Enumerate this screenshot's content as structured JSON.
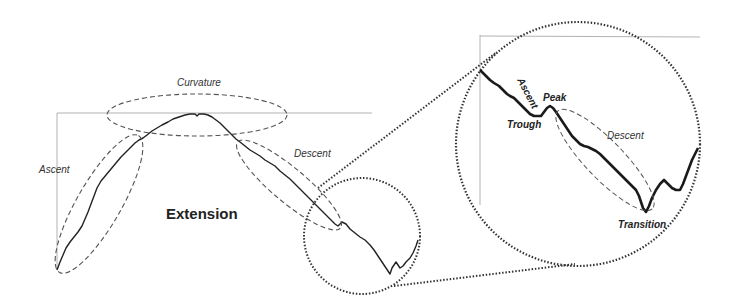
{
  "diagram": {
    "title": "Extension",
    "left_panel": {
      "labels": {
        "curvature": "Curvature",
        "ascent": "Ascent",
        "descent": "Descent",
        "extension": "Extension"
      }
    },
    "magnified_panel": {
      "labels": {
        "ascent": "Ascent",
        "peak": "Peak",
        "trough": "Trough",
        "descent": "Descent",
        "transition": "Transition"
      }
    },
    "colors": {
      "curve": "#1a1a1a",
      "dashed_ellipse": "#555555",
      "dotted_circle": "#333333",
      "frame": "#999999",
      "background": "#ffffff"
    }
  }
}
